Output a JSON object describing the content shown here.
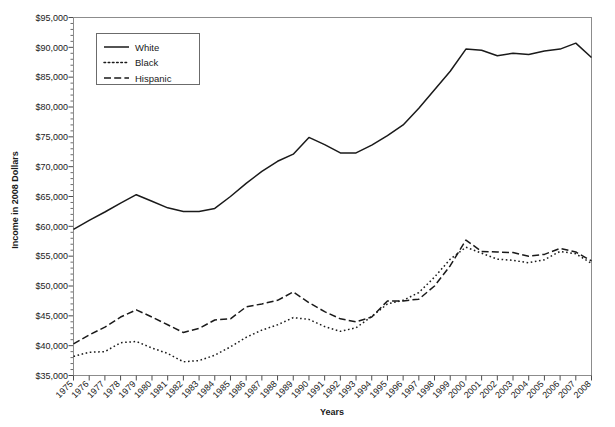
{
  "chart_data": {
    "type": "line",
    "title": "",
    "xlabel": "Years",
    "ylabel": "Income in 2008 Dollars",
    "grid": false,
    "legend_position": "top-left-inside",
    "xlim": [
      1975,
      2008
    ],
    "ylim": [
      35000,
      95000
    ],
    "y_tick_step": 5000,
    "y_minor_tick_step": 1000,
    "x": [
      1975,
      1976,
      1977,
      1978,
      1979,
      1980,
      1981,
      1982,
      1983,
      1984,
      1985,
      1986,
      1987,
      1988,
      1989,
      1990,
      1991,
      1992,
      1993,
      1994,
      1995,
      1996,
      1997,
      1998,
      1999,
      2000,
      2001,
      2002,
      2003,
      2004,
      2005,
      2006,
      2007,
      2008
    ],
    "categories": [
      "1975",
      "1976",
      "1977",
      "1978",
      "1979",
      "1980",
      "1981",
      "1982",
      "1983",
      "1984",
      "1985",
      "1986",
      "1987",
      "1988",
      "1989",
      "1990",
      "1991",
      "1992",
      "1993",
      "1994",
      "1995",
      "1996",
      "1997",
      "1998",
      "1999",
      "2000",
      "2001",
      "2002",
      "2003",
      "2004",
      "2005",
      "2006",
      "2007",
      "2008"
    ],
    "y_tick_labels": [
      "$35,000",
      "$40,000",
      "$45,000",
      "$50,000",
      "$55,000",
      "$60,000",
      "$65,000",
      "$70,000",
      "$75,000",
      "$80,000",
      "$85,000",
      "$90,000",
      "$95,000"
    ],
    "y_tick_values": [
      35000,
      40000,
      45000,
      50000,
      55000,
      60000,
      65000,
      70000,
      75000,
      80000,
      85000,
      90000,
      95000
    ],
    "series": [
      {
        "name": "White",
        "style": "solid",
        "values": [
          59500,
          61000,
          62400,
          63900,
          65300,
          64200,
          63100,
          62500,
          62500,
          63000,
          65000,
          67200,
          69200,
          70900,
          72100,
          74900,
          73700,
          72300,
          72300,
          73600,
          75200,
          77000,
          79800,
          82900,
          86000,
          89700,
          89500,
          88600,
          89000,
          88800,
          89400,
          89700,
          90700,
          88300
        ]
      },
      {
        "name": "Black",
        "style": "dotted",
        "values": [
          38200,
          38900,
          39000,
          40500,
          40700,
          39600,
          38700,
          37300,
          37500,
          38400,
          39800,
          41400,
          42600,
          43500,
          44700,
          44400,
          43200,
          42400,
          43000,
          44900,
          47000,
          47600,
          48900,
          51500,
          54500,
          56500,
          55500,
          54500,
          54300,
          53900,
          54400,
          55800,
          55400,
          53800
        ]
      },
      {
        "name": "Hispanic",
        "style": "dashed",
        "values": [
          40300,
          41800,
          43100,
          44800,
          46000,
          44800,
          43500,
          42200,
          42900,
          44300,
          44500,
          46500,
          47000,
          47600,
          49000,
          47200,
          45700,
          44500,
          44000,
          44800,
          47500,
          47500,
          47800,
          50000,
          53400,
          57700,
          55800,
          55700,
          55600,
          55000,
          55300,
          56300,
          55700,
          54200
        ]
      }
    ]
  },
  "legend": {
    "items": [
      {
        "label": "White",
        "style": "solid"
      },
      {
        "label": "Black",
        "style": "dotted"
      },
      {
        "label": "Hispanic",
        "style": "dashed"
      }
    ]
  },
  "colors": {
    "line": "#1a1a1a",
    "frame": "#8c8c8c",
    "text": "#1a1a1a",
    "background": "#ffffff"
  }
}
